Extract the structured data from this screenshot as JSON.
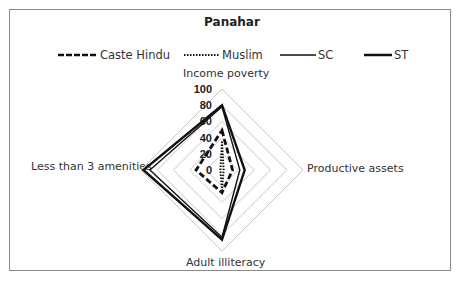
{
  "chart_data": {
    "type": "radar",
    "title": "Panahar",
    "axes": [
      "Income poverty",
      "Productive assets",
      "Adult illiteracy",
      "Less than 3 amenities"
    ],
    "rlim": [
      0,
      100
    ],
    "ticks": [
      "0",
      "20",
      "40",
      "60",
      "80",
      "100"
    ],
    "grid": true,
    "legend_position": "top",
    "series": [
      {
        "name": "Caste Hindu",
        "style": "dashed",
        "values": [
          49,
          13,
          28,
          32
        ]
      },
      {
        "name": "Muslim",
        "style": "dotted",
        "values": [
          35,
          2,
          25,
          2
        ]
      },
      {
        "name": "SC",
        "style": "thin-solid",
        "values": [
          78,
          22,
          83,
          89
        ]
      },
      {
        "name": "ST",
        "style": "thick-solid",
        "values": [
          80,
          28,
          86,
          97
        ]
      }
    ]
  },
  "legend": {
    "caste_hindu": "Caste Hindu",
    "muslim": "Muslim",
    "sc": "SC",
    "st": "ST"
  },
  "labels": {
    "top": "Income poverty",
    "right": "Productive assets",
    "bottom": "Adult illiteracy",
    "left": "Less than 3 amenities"
  },
  "colors": {
    "grid": "#c8c8c8",
    "series": "#111111",
    "frame": "#8a8a8a"
  }
}
